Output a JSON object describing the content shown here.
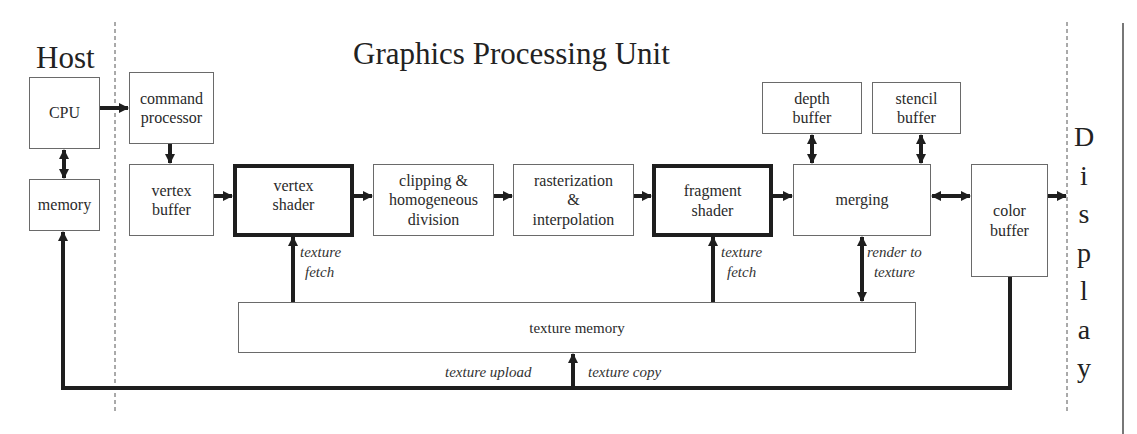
{
  "titles": {
    "host": "Host",
    "gpu": "Graphics Processing Unit",
    "display_letters": [
      "D",
      "i",
      "s",
      "p",
      "l",
      "a",
      "y"
    ]
  },
  "host_blocks": {
    "cpu": "CPU",
    "memory": "memory"
  },
  "gpu_blocks": {
    "command_processor": [
      "command",
      "processor"
    ],
    "vertex_buffer": [
      "vertex",
      "buffer"
    ],
    "vertex_shader": [
      "vertex",
      "shader"
    ],
    "clipping": [
      "clipping &",
      "homogeneous",
      "division"
    ],
    "rasterization": [
      "rasterization",
      "&",
      "interpolation"
    ],
    "fragment_shader": [
      "fragment",
      "shader"
    ],
    "merging": "merging",
    "depth_buffer": [
      "depth",
      "buffer"
    ],
    "stencil_buffer": [
      "stencil",
      "buffer"
    ],
    "color_buffer": [
      "color",
      "buffer"
    ],
    "texture_memory": "texture memory"
  },
  "edge_labels": {
    "vertex_texture_fetch": [
      "texture",
      "fetch"
    ],
    "fragment_texture_fetch": [
      "texture",
      "fetch"
    ],
    "render_to_texture": [
      "render to",
      "texture"
    ],
    "texture_upload": "texture upload",
    "texture_copy": "texture copy"
  },
  "colors": {
    "line": "#1e1e1e",
    "box_border": "#6a6a6a",
    "dashed": "#555555",
    "text": "#222222"
  }
}
